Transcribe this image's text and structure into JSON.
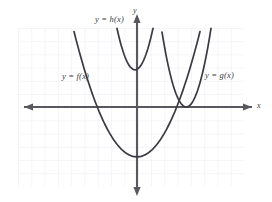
{
  "figure": {
    "title": "",
    "background_color": "#ffffff",
    "grid_color": "#e9e9ef",
    "axis_color": "#58585f",
    "curve_color": "#3a3a42",
    "label_color": "#3a3a42"
  },
  "axes": {
    "x_label": "x",
    "y_label": "y",
    "x_axis_pixel_y": 107,
    "y_axis_pixel_x": 137
  },
  "labels": {
    "f": "y = f(x)",
    "g": "y = g(x)",
    "h": "y = h(x)"
  },
  "chart_data": {
    "type": "line",
    "title": "",
    "xlabel": "x",
    "ylabel": "y",
    "xlim": [
      -9,
      8
    ],
    "ylim": [
      -6,
      6
    ],
    "grid": true,
    "legend": "inline-annotations",
    "cell_size_px": 13.3,
    "series": [
      {
        "name": "y = f(x)",
        "label": "y = f(x)",
        "shape": "parabola",
        "vertex": [
          0,
          -3.75
        ],
        "leading_coefficient": 0.42,
        "direction": "opens-up",
        "x_intercepts": [
          -3.0,
          3.0
        ],
        "x": [
          -4.4,
          -4.0,
          -3.5,
          -3.0,
          -2.5,
          -2.0,
          -1.5,
          -1.0,
          -0.5,
          0.0,
          0.5,
          1.0,
          1.5,
          2.0,
          2.5,
          3.0,
          3.5,
          4.0,
          4.4
        ],
        "y": [
          4.4,
          2.97,
          1.4,
          0.03,
          -1.13,
          -2.07,
          -2.81,
          -3.33,
          -3.64,
          -3.75,
          -3.64,
          -3.33,
          -2.81,
          -2.07,
          -1.13,
          0.03,
          1.4,
          2.97,
          4.4
        ]
      },
      {
        "name": "y = h(x)",
        "label": "y = h(x)",
        "shape": "parabola",
        "vertex": [
          -0.15,
          2.8
        ],
        "leading_coefficient": 1.7,
        "direction": "opens-up",
        "x_intercepts": [],
        "x": [
          -1.2,
          -1.0,
          -0.8,
          -0.6,
          -0.4,
          -0.15,
          0.1,
          0.3,
          0.5,
          0.7,
          0.9,
          1.1
        ],
        "y": [
          4.78,
          4.08,
          3.54,
          3.14,
          2.91,
          2.8,
          2.91,
          3.14,
          3.45,
          3.99,
          4.58,
          5.25
        ]
      },
      {
        "name": "y = g(x)",
        "label": "y = g(x)",
        "shape": "parabola",
        "vertex": [
          3.7,
          0.0
        ],
        "leading_coefficient": 1.7,
        "direction": "opens-up",
        "x_intercepts": [
          3.7
        ],
        "x": [
          1.9,
          2.2,
          2.5,
          2.8,
          3.1,
          3.4,
          3.7,
          4.0,
          4.3,
          4.6,
          4.9,
          5.2,
          5.5
        ],
        "y": [
          5.51,
          4.08,
          2.86,
          1.38,
          0.61,
          0.15,
          0.0,
          0.15,
          0.61,
          1.38,
          2.45,
          3.82,
          5.51
        ]
      }
    ]
  }
}
